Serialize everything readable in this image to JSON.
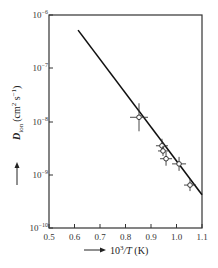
{
  "chart_data": {
    "type": "scatter",
    "title": "",
    "xlabel": "10^3/T (K)",
    "ylabel": "D_ion (cm^2 s^-1)",
    "xlim": [
      0.5,
      1.1
    ],
    "ylim": [
      1e-10,
      1e-06
    ],
    "yscale": "log",
    "grid": false,
    "legend": null,
    "x_ticks": [
      "0.5",
      "0.6",
      "0.7",
      "0.8",
      "0.9",
      "1.0",
      "1.1"
    ],
    "y_ticks": [
      "10^-10",
      "10^-9",
      "10^-8",
      "10^-7",
      "10^-6"
    ],
    "series": [
      {
        "name": "measured",
        "style": "open-circle-with-errorbars",
        "points": [
          {
            "x": 0.853,
            "y": 1.2e-08
          },
          {
            "x": 0.943,
            "y": 3.5e-09
          },
          {
            "x": 0.947,
            "y": 2.8e-09
          },
          {
            "x": 0.959,
            "y": 2e-09
          },
          {
            "x": 1.01,
            "y": 1.6e-09
          },
          {
            "x": 1.053,
            "y": 6.4e-10
          }
        ]
      },
      {
        "name": "fit",
        "style": "line",
        "points": [
          {
            "x": 0.614,
            "y": 5.2e-07
          },
          {
            "x": 1.1,
            "y": 4.2e-10
          }
        ]
      }
    ]
  },
  "axes": {
    "x_ticks": [
      {
        "label": "0.5",
        "px": 49
      },
      {
        "label": "0.6",
        "px": 74.5
      },
      {
        "label": "0.7",
        "px": 100
      },
      {
        "label": "0.8",
        "px": 125.5
      },
      {
        "label": "0.9",
        "px": 151
      },
      {
        "label": "1.0",
        "px": 176.5
      },
      {
        "label": "1.1",
        "px": 202
      }
    ],
    "y_ticks": [
      {
        "base": "10",
        "exp": "−6",
        "py": 15
      },
      {
        "base": "10",
        "exp": "−7",
        "py": 68
      },
      {
        "base": "10",
        "exp": "−8",
        "py": 122
      },
      {
        "base": "10",
        "exp": "−9",
        "py": 175
      },
      {
        "base": "10",
        "exp": "−10",
        "py": 228
      }
    ],
    "x_title": {
      "prefix": "10",
      "sup": "3",
      "rest": "/T (K)",
      "arrow": "⟶"
    },
    "y_title": {
      "D": "D",
      "sub": "ion",
      "units_open": "(cm",
      "sup1": "2",
      "mid": " s",
      "sup2": "−1",
      "close": ")"
    }
  }
}
